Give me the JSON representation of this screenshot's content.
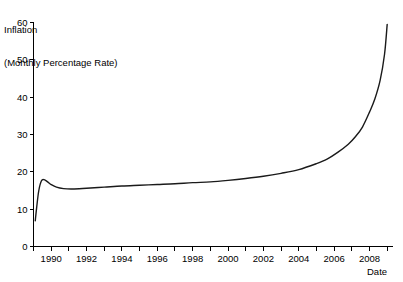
{
  "chart_data": {
    "type": "line",
    "title": "",
    "ylabel_lines": [
      "Inflation",
      "(Monthly Percentage Rate)"
    ],
    "ylabel": "Inflation (Monthly Percentage Rate)",
    "xlabel": "Date",
    "grid": false,
    "legend": "none",
    "xlim": [
      1989.0,
      2009.3
    ],
    "ylim": [
      0,
      60
    ],
    "yticks": [
      0,
      10,
      20,
      30,
      40,
      50,
      60
    ],
    "ytick_labels": [
      "0",
      "10",
      "20",
      "30",
      "40",
      "50",
      "60"
    ],
    "xticks": [
      1989,
      1990,
      1991,
      1992,
      1993,
      1994,
      1995,
      1996,
      1997,
      1998,
      1999,
      2000,
      2001,
      2002,
      2003,
      2004,
      2005,
      2006,
      2007,
      2008,
      2009
    ],
    "xtick_labels_shown": [
      "1990",
      "1992",
      "1994",
      "1996",
      "1998",
      "2000",
      "2002",
      "2004",
      "2006",
      "2008"
    ],
    "xtick_labels_values": [
      1990,
      1992,
      1994,
      1996,
      1998,
      2000,
      2002,
      2004,
      2006,
      2008
    ],
    "series": [
      {
        "name": "Inflation",
        "color": "#1a1a1a",
        "x": [
          1989.1,
          1989.18,
          1989.3,
          1989.45,
          1989.6,
          1989.8,
          1990.0,
          1990.3,
          1990.7,
          1991.2,
          1992.0,
          1993.0,
          1994.0,
          1995.0,
          1996.0,
          1997.0,
          1998.0,
          1999.0,
          2000.0,
          2001.0,
          2002.0,
          2003.0,
          2004.0,
          2005.0,
          2005.6,
          2006.2,
          2006.8,
          2007.2,
          2007.6,
          2008.0,
          2008.3,
          2008.6,
          2008.85,
          2009.0
        ],
        "y": [
          6.9,
          10.5,
          15.0,
          17.6,
          17.9,
          17.3,
          16.6,
          15.9,
          15.5,
          15.4,
          15.6,
          15.9,
          16.2,
          16.4,
          16.6,
          16.8,
          17.1,
          17.3,
          17.7,
          18.2,
          18.8,
          19.6,
          20.6,
          22.2,
          23.4,
          25.2,
          27.4,
          29.4,
          32.0,
          36.0,
          39.5,
          44.5,
          51.5,
          59.5
        ]
      }
    ]
  },
  "axes": {
    "ylabel_line1": "Inflation",
    "ylabel_line2": "(Monthly Percentage Rate)",
    "xlabel": "Date"
  }
}
